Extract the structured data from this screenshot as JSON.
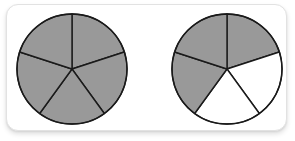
{
  "figure": {
    "colors": {
      "shaded_fill": "#999999",
      "unshaded_fill": "#ffffff",
      "stroke": "#1a1a1a",
      "frame_border": "#e2e2e2",
      "background": "#ffffff"
    },
    "stroke_width": 1.4,
    "circles": [
      {
        "id": "left-circle",
        "name": "circle-left",
        "label": "5/5",
        "cx": 72,
        "cy": 69,
        "r": 55,
        "sector_count": 5,
        "shaded_count": 5,
        "start_angle_deg": -90,
        "sectors": [
          {
            "index": 0,
            "start_deg": -90,
            "end_deg": -18,
            "shaded": true
          },
          {
            "index": 1,
            "start_deg": -18,
            "end_deg": 54,
            "shaded": true
          },
          {
            "index": 2,
            "start_deg": 54,
            "end_deg": 126,
            "shaded": true
          },
          {
            "index": 3,
            "start_deg": 126,
            "end_deg": 198,
            "shaded": true
          },
          {
            "index": 4,
            "start_deg": 198,
            "end_deg": 270,
            "shaded": true
          }
        ]
      },
      {
        "id": "right-circle",
        "name": "circle-right",
        "label": "3/5",
        "cx": 227,
        "cy": 69,
        "r": 55,
        "sector_count": 5,
        "shaded_count": 3,
        "start_angle_deg": -90,
        "sectors": [
          {
            "index": 0,
            "start_deg": -90,
            "end_deg": -18,
            "shaded": true
          },
          {
            "index": 1,
            "start_deg": -18,
            "end_deg": 54,
            "shaded": false
          },
          {
            "index": 2,
            "start_deg": 54,
            "end_deg": 126,
            "shaded": false
          },
          {
            "index": 3,
            "start_deg": 126,
            "end_deg": 198,
            "shaded": true
          },
          {
            "index": 4,
            "start_deg": 198,
            "end_deg": 270,
            "shaded": true
          }
        ]
      }
    ]
  }
}
